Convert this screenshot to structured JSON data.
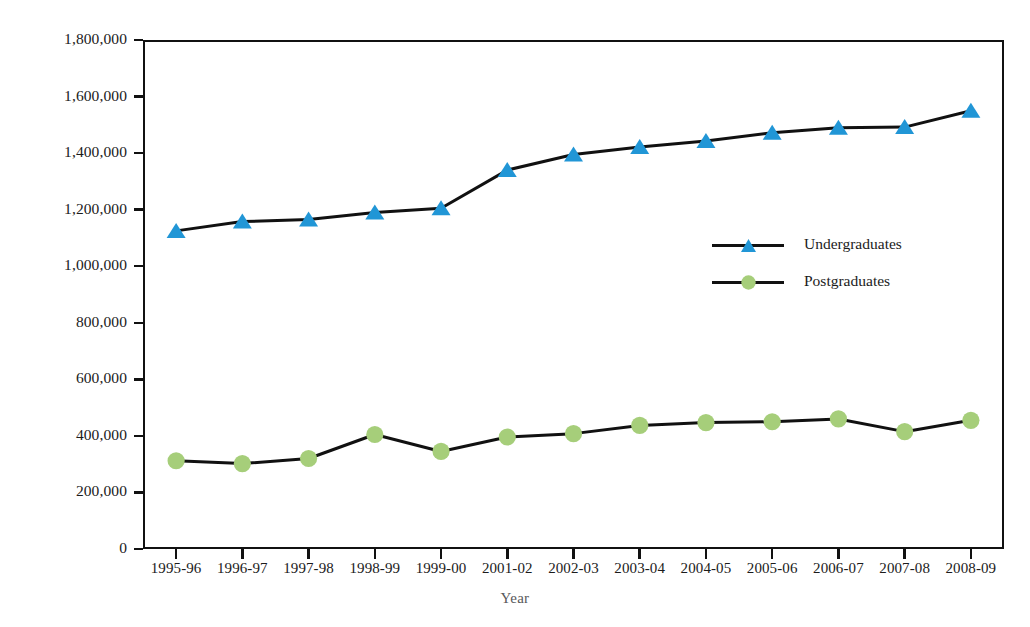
{
  "chart_data": {
    "type": "line",
    "title": "",
    "xlabel": "Year",
    "ylabel": "No. of students",
    "categories": [
      "1995-96",
      "1996-97",
      "1997-98",
      "1998-99",
      "1999-00",
      "2001-02",
      "2002-03",
      "2003-04",
      "2004-05",
      "2005-06",
      "2006-07",
      "2007-08",
      "2008-09"
    ],
    "series": [
      {
        "name": "Undergraduates",
        "marker": "triangle",
        "color": "#2196d6",
        "line_color": "#111111",
        "values": [
          1125000,
          1158000,
          1165000,
          1190000,
          1205000,
          1340000,
          1395000,
          1422000,
          1443000,
          1472000,
          1490000,
          1492000,
          1550000
        ]
      },
      {
        "name": "Postgraduates",
        "marker": "circle",
        "color": "#a6ce7a",
        "line_color": "#111111",
        "values": [
          312000,
          302000,
          320000,
          405000,
          345000,
          396000,
          408000,
          437000,
          447000,
          450000,
          460000,
          415000,
          455000
        ]
      }
    ],
    "ylim": [
      0,
      1800000
    ],
    "ytick_values": [
      0,
      200000,
      400000,
      600000,
      800000,
      1000000,
      1200000,
      1400000,
      1600000,
      1800000
    ],
    "ytick_labels": [
      "0",
      "200,000",
      "400,000",
      "600,000",
      "800,000",
      "1,000,000",
      "1,200,000",
      "1,400,000",
      "1,600,000",
      "1,800,000"
    ],
    "grid": false,
    "legend_position": "inside-right"
  },
  "colors": {
    "undergraduates": "#2196d6",
    "postgraduates": "#a6ce7a",
    "line": "#111111",
    "axis": "#111111",
    "axis_title": "#58585a",
    "tick_text": "#1b1b1b",
    "background": "#ffffff"
  }
}
